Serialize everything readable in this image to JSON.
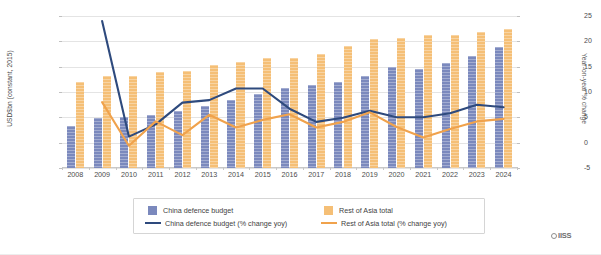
{
  "chart_data": {
    "type": "bar",
    "title": "",
    "xlabel": "",
    "ylabel": "USD$bn (constant, 2015)",
    "y2label": "Year-on-year % change",
    "categories": [
      "2008",
      "2009",
      "2010",
      "2011",
      "2012",
      "2013",
      "2014",
      "2015",
      "2016",
      "2017",
      "2018",
      "2019",
      "2020",
      "2021",
      "2022",
      "2023",
      "2024"
    ],
    "ylim": [
      0,
      300
    ],
    "y2lim": [
      -5,
      25
    ],
    "yticks": [
      "0",
      "50",
      "100",
      "150",
      "200",
      "250",
      "300"
    ],
    "y2ticks": [
      "-5",
      "0",
      "5",
      "10",
      "15",
      "20",
      "25"
    ],
    "grid": true,
    "legend_position": "bottom",
    "series": [
      {
        "name": "China defence budget",
        "type": "bar",
        "axis": "left",
        "color": "#7b89bd",
        "values": [
          83,
          98,
          101,
          105,
          113,
          122,
          135,
          147,
          157,
          164,
          170,
          182,
          199,
          196,
          207,
          222,
          239
        ]
      },
      {
        "name": "Rest of Asia total",
        "type": "bar",
        "axis": "left",
        "color": "#f5bf76",
        "values": [
          169,
          182,
          182,
          190,
          192,
          203,
          209,
          218,
          217,
          225,
          240,
          255,
          257,
          262,
          262,
          268,
          275
        ]
      },
      {
        "name": "China defence budget (% change yoy)",
        "type": "line",
        "axis": "right",
        "color": "#2e4a7d",
        "values": [
          null,
          24.0,
          1.2,
          3.6,
          7.9,
          8.4,
          10.7,
          10.7,
          6.7,
          4.1,
          4.9,
          6.3,
          5.0,
          5.0,
          5.8,
          7.5,
          7.0
        ]
      },
      {
        "name": "Rest of Asia total (% change yoy)",
        "type": "line",
        "axis": "right",
        "color": "#f0a24c",
        "values": [
          null,
          8.0,
          -0.6,
          4.2,
          1.5,
          5.5,
          3.0,
          4.5,
          5.6,
          3.0,
          4.1,
          6.0,
          3.1,
          1.0,
          2.7,
          4.2,
          4.7
        ]
      }
    ],
    "legend": [
      {
        "label": "China defence budget",
        "marker": "square",
        "color": "#7b89bd"
      },
      {
        "label": "Rest of Asia total",
        "marker": "square",
        "color": "#f5bf76"
      },
      {
        "label": "China defence budget (% change yoy)",
        "marker": "line",
        "color": "#2e4a7d"
      },
      {
        "label": "Rest of Asia total (% change yoy)",
        "marker": "line",
        "color": "#f0a24c"
      }
    ],
    "source": {
      "name": "IISS",
      "mark": "circle-icon"
    }
  }
}
